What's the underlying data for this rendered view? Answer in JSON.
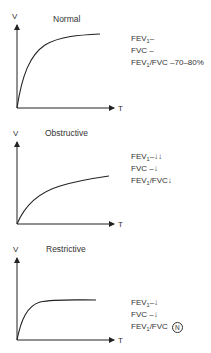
{
  "panels": [
    {
      "title": "Normal",
      "y_axis": "V",
      "x_axis": "T",
      "fev1": "FEV",
      "fev1_sub": "1",
      "fev1_val": "–",
      "fvc": "FVC –",
      "ratio_pre": "FEV",
      "ratio_sub": "1",
      "ratio_post": "/FVC –70–80%",
      "ratio_badge": ""
    },
    {
      "title": "Obstructive",
      "y_axis": "V",
      "x_axis": "T",
      "fev1": "FEV",
      "fev1_sub": "1",
      "fev1_val": "–↓↓",
      "fvc": "FVC –↓",
      "ratio_pre": "FEV",
      "ratio_sub": "1",
      "ratio_post": "/FVC↓",
      "ratio_badge": ""
    },
    {
      "title": "Restrictive",
      "y_axis": "V",
      "x_axis": "T",
      "fev1": "FEV",
      "fev1_sub": "1",
      "fev1_val": "–↓",
      "fvc": "FVC –↓",
      "ratio_pre": "FEV",
      "ratio_sub": "1",
      "ratio_post": "/FVC",
      "ratio_badge": "N"
    }
  ]
}
